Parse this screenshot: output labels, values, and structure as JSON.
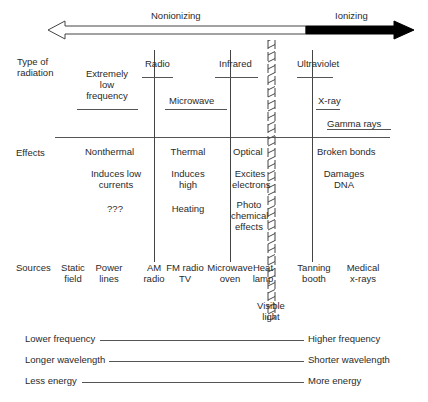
{
  "title_arrow": {
    "nonionizing_label": "Nonionizing",
    "ionizing_label": "Ionizing"
  },
  "row_labels": {
    "type": [
      "Type of",
      "radiation"
    ],
    "effects": "Effects",
    "sources": "Sources"
  },
  "types": {
    "elf": [
      "Extremely",
      "low",
      "frequency"
    ],
    "radio": "Radio",
    "microwave": "Microwave",
    "infrared": "Infrared",
    "ultraviolet": "Ultraviolet",
    "xray": "X-ray",
    "gamma": "Gamma rays"
  },
  "effects": {
    "nonthermal": "Nonthermal",
    "induces_low": [
      "Induces low",
      "currents"
    ],
    "unknown": "???",
    "thermal": "Thermal",
    "induces_high": [
      "Induces",
      "high"
    ],
    "heating": "Heating",
    "optical": "Optical",
    "excites": [
      "Excites",
      "electrons"
    ],
    "photochem": [
      "Photo",
      "chemical",
      "effects"
    ],
    "broken_bonds": "Broken bonds",
    "damages_dna": [
      "Damages",
      "DNA"
    ]
  },
  "sources": {
    "static_field": [
      "Static",
      "field"
    ],
    "power_lines": [
      "Power",
      "lines"
    ],
    "am_radio": [
      "AM",
      "radio"
    ],
    "fm_radio": [
      "FM radio",
      "TV"
    ],
    "microwave_oven": [
      "Microwave",
      "oven"
    ],
    "heat_lamp": [
      "Heat",
      "lamp"
    ],
    "tanning_booth": [
      "Tanning",
      "booth"
    ],
    "medical_xrays": [
      "Medical",
      "x-rays"
    ],
    "visible_light": [
      "Visible",
      "light"
    ]
  },
  "scales": [
    {
      "left": "Lower frequency",
      "right": "Higher frequency"
    },
    {
      "left": "Longer wavelength",
      "right": "Shorter wavelength"
    },
    {
      "left": "Less energy",
      "right": "More energy"
    }
  ]
}
